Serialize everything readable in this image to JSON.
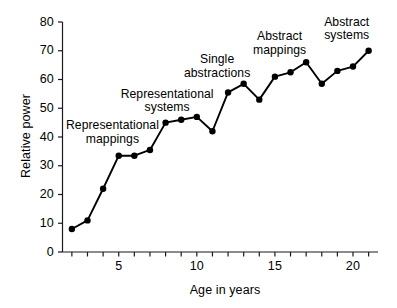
{
  "chart_data": {
    "type": "line",
    "title": "",
    "xlabel": "Age in years",
    "ylabel": "Relative power",
    "xlim": [
      1.4,
      21.6
    ],
    "ylim": [
      0,
      80
    ],
    "grid": false,
    "legend": "none",
    "marker": "filled-circle",
    "line_color": "#000000",
    "marker_color": "#000000",
    "x": [
      2,
      3,
      4,
      5,
      6,
      7,
      8,
      9,
      10,
      11,
      12,
      13,
      14,
      15,
      16,
      17,
      18,
      19,
      20,
      21
    ],
    "values": [
      8,
      11,
      22,
      33.5,
      33.5,
      35.5,
      45,
      46,
      47,
      42,
      55.5,
      58.5,
      53,
      61,
      62.5,
      66,
      58.5,
      63,
      64.5,
      70
    ],
    "series": [
      {
        "name": "Relative power",
        "values": [
          8,
          11,
          22,
          33.5,
          33.5,
          35.5,
          45,
          46,
          47,
          42,
          55.5,
          58.5,
          53,
          61,
          62.5,
          66,
          58.5,
          63,
          64.5,
          70
        ]
      }
    ],
    "y_ticks": [
      0,
      10,
      20,
      30,
      40,
      50,
      60,
      70,
      80
    ],
    "y_tick_labels": [
      "0",
      "10",
      "20",
      "30",
      "40",
      "50",
      "60",
      "70",
      "80"
    ],
    "x_ticks": [
      2,
      3,
      4,
      5,
      6,
      7,
      8,
      9,
      10,
      11,
      12,
      13,
      14,
      15,
      16,
      17,
      18,
      19,
      20,
      21
    ],
    "x_tick_labels": [
      "",
      "",
      "",
      "5",
      "",
      "",
      "",
      "",
      "10",
      "",
      "",
      "",
      "",
      "15",
      "",
      "",
      "",
      "",
      "20",
      ""
    ],
    "x_labeled_ticks": [
      {
        "value": 5,
        "label": "5"
      },
      {
        "value": 10,
        "label": "10"
      },
      {
        "value": 15,
        "label": "15"
      },
      {
        "value": 20,
        "label": "20"
      }
    ],
    "annotations": [
      {
        "text": "Representational\nmappings",
        "x": 4.6,
        "y": 41.5,
        "name": "representational-mappings"
      },
      {
        "text": "Representational\nsystems",
        "x": 8.1,
        "y": 52.5,
        "name": "representational-systems"
      },
      {
        "text": "Single\nabstractions",
        "x": 11.3,
        "y": 64.5,
        "name": "single-abstractions"
      },
      {
        "text": "Abstract\nmappings",
        "x": 15.3,
        "y": 72.5,
        "name": "abstract-mappings"
      },
      {
        "text": "Abstract\nsystems",
        "x": 19.6,
        "y": 77.5,
        "name": "abstract-systems"
      }
    ]
  }
}
